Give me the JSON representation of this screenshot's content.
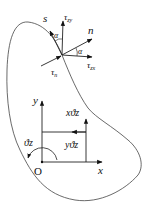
{
  "diagram": {
    "type": "torsion cross-section stress diagram",
    "colors": {
      "stroke": "#222222",
      "background": "#ffffff"
    },
    "boundary_point_labels": {
      "s_axis": "s",
      "n_axis": "n",
      "tau_zy": "τzy",
      "tau_zx": "τzx",
      "tau_n": "τn",
      "alpha_top": "α",
      "alpha_right": "α"
    },
    "coordinate_system": {
      "origin": "O",
      "x_axis": "x",
      "y_axis": "y",
      "rotation": "ϑz",
      "vertical_displacement": "xϑz",
      "horizontal_displacement": "yϑz"
    }
  }
}
